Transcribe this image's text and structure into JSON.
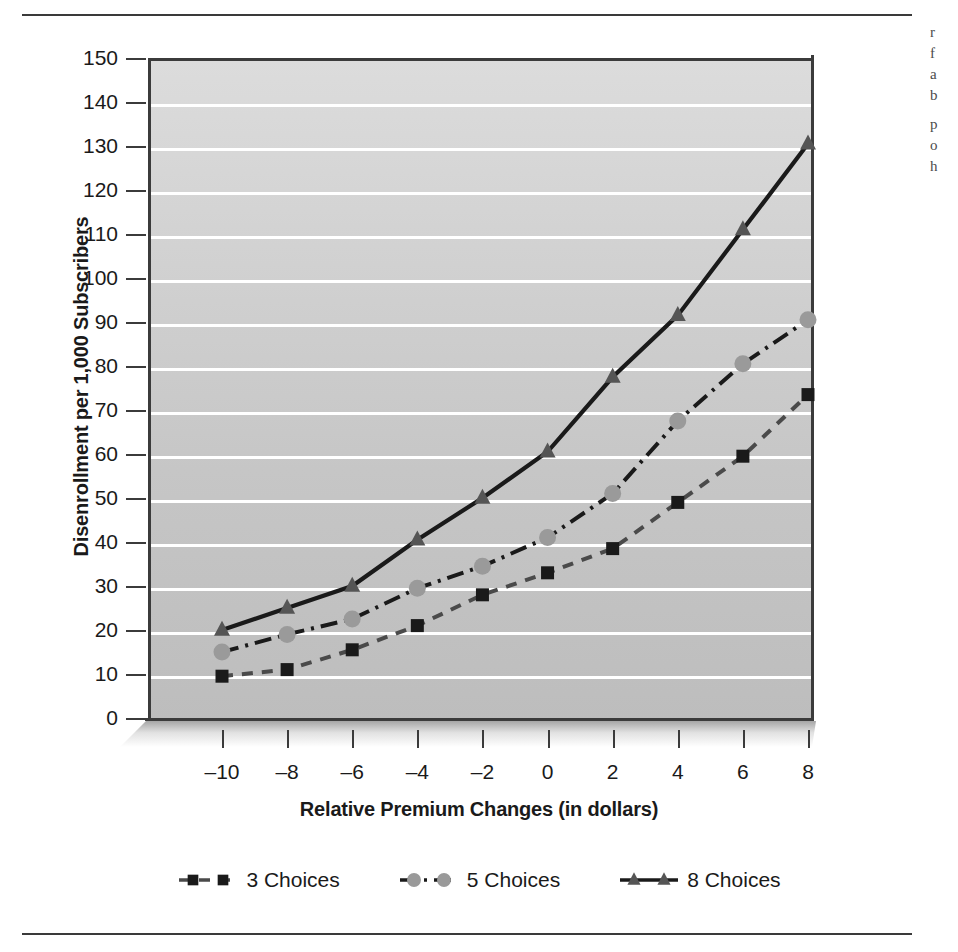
{
  "page": {
    "rule_top": "",
    "rule_bottom": "",
    "bleed_text": [
      "r",
      "f",
      "a",
      "b",
      "p",
      "o",
      "h"
    ]
  },
  "chart_data": {
    "type": "line",
    "title": "",
    "xlabel": "Relative Premium Changes (in dollars)",
    "ylabel": "Disenrollment per 1,000 Subscribers",
    "x": [
      -10,
      -8,
      -6,
      -4,
      -2,
      0,
      2,
      4,
      6,
      8
    ],
    "xtick_labels": [
      "–10",
      "–8",
      "–6",
      "–4",
      "–2",
      "0",
      "2",
      "4",
      "6",
      "8"
    ],
    "ytick_labels": [
      "0",
      "10",
      "20",
      "30",
      "40",
      "50",
      "60",
      "70",
      "80",
      "90",
      "100",
      "110",
      "120",
      "130",
      "140",
      "150"
    ],
    "yticks": [
      0,
      10,
      20,
      30,
      40,
      50,
      60,
      70,
      80,
      90,
      100,
      110,
      120,
      130,
      140,
      150
    ],
    "xlim": [
      -10,
      8
    ],
    "ylim": [
      0,
      150
    ],
    "grid": true,
    "grid_color": "#ffffff",
    "plot_bg": "#cccccc",
    "axis_color": "#3b3b3b",
    "legend_position": "below",
    "series": [
      {
        "name": "3 Choices",
        "values": [
          9.5,
          11,
          15.5,
          21,
          28,
          33,
          38.5,
          49,
          59.5,
          73.5
        ],
        "color": "#4a4a4a",
        "marker": "square",
        "marker_color": "#1a1a1a",
        "dash": "dashed"
      },
      {
        "name": "5 Choices",
        "values": [
          15,
          19,
          22.5,
          29.5,
          34.5,
          41,
          51,
          67.5,
          80.5,
          90.5
        ],
        "color": "#1a1a1a",
        "marker": "circle",
        "marker_color": "#9a9a9a",
        "dash": "dash-dot"
      },
      {
        "name": "8 Choices",
        "values": [
          20,
          25,
          30,
          40.5,
          50,
          60.5,
          77.5,
          91.5,
          111,
          130.5
        ],
        "color": "#1a1a1a",
        "marker": "triangle",
        "marker_color": "#555555",
        "dash": "solid"
      }
    ]
  },
  "legend": {
    "items": [
      {
        "label": "3 Choices"
      },
      {
        "label": "5 Choices"
      },
      {
        "label": "8 Choices"
      }
    ]
  }
}
